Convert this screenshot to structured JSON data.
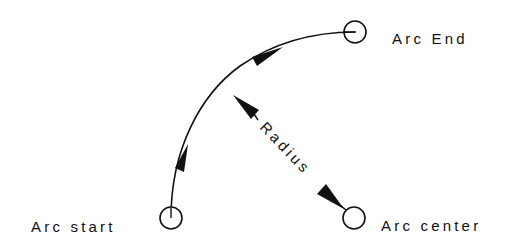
{
  "diagram": {
    "colors": {
      "stroke": "#111111",
      "background": "#ffffff"
    },
    "labels": {
      "arc_start": "Arc start",
      "arc_end": "Arc End",
      "arc_center": "Arc center",
      "radius": "Radius"
    },
    "points": {
      "arc_start": {
        "x": 171,
        "y": 218,
        "r": 11
      },
      "arc_end": {
        "x": 355,
        "y": 32,
        "r": 11
      },
      "arc_center": {
        "x": 354,
        "y": 218,
        "r": 11
      }
    },
    "icons": {
      "arc_direction_arrow": "filled-triangle-arrowhead",
      "radius_arrow": "double-headed-arrow"
    }
  }
}
